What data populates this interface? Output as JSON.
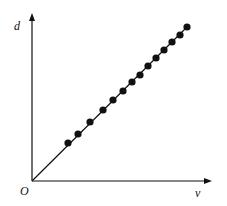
{
  "chart_data": {
    "type": "scatter",
    "title": "",
    "xlabel": "v",
    "ylabel": "d",
    "origin_label": "O",
    "grid": false,
    "legend": null,
    "fit_line": {
      "from": [
        0,
        0
      ],
      "to": [
        155,
        154
      ],
      "style": "solid"
    },
    "points": [
      {
        "x": 36,
        "y": 38
      },
      {
        "x": 46,
        "y": 47
      },
      {
        "x": 58,
        "y": 59
      },
      {
        "x": 71,
        "y": 71
      },
      {
        "x": 81,
        "y": 81
      },
      {
        "x": 91,
        "y": 90
      },
      {
        "x": 100,
        "y": 99
      },
      {
        "x": 108,
        "y": 106
      },
      {
        "x": 116,
        "y": 115
      },
      {
        "x": 124,
        "y": 123
      },
      {
        "x": 132,
        "y": 131
      },
      {
        "x": 140,
        "y": 139
      },
      {
        "x": 148,
        "y": 146
      },
      {
        "x": 155,
        "y": 154
      }
    ],
    "note": "Values in pixel units from origin; axes have no ticks. Points lie on a straight line through the origin."
  },
  "labels": {
    "x_axis": "v",
    "y_axis": "d",
    "origin": "O"
  }
}
